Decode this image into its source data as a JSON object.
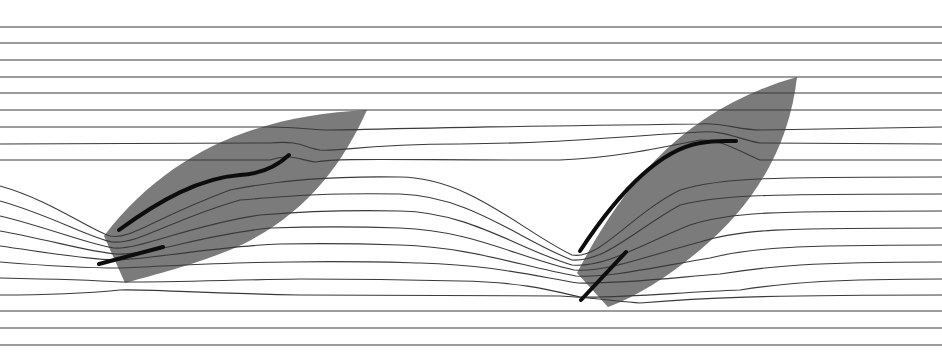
{
  "diagram": {
    "width": 942,
    "height": 357,
    "colors": {
      "background": "#ffffff",
      "hull": "#7b7b7b",
      "streamline": "#3a3a3a",
      "sail": "#0d0d0d"
    },
    "boats": [
      {
        "name": "boat-1",
        "hull": "M104,236 C170,150 260,115 367,110 C340,170 300,220 230,250 C190,266 150,276 125,283 Z",
        "mainsail": "M119,230 C160,200 200,178 240,175 C260,174 275,168 289,155",
        "jib": "M99,264 L163,247"
      },
      {
        "name": "boat-2",
        "hull": "M577,273 C620,190 680,110 797,77 C790,140 760,200 700,250 C670,275 640,295 608,307 Z",
        "mainsail": "M580,251 C620,190 660,150 700,143 C715,140 725,141 736,141",
        "jib": "M581,300 L626,252"
      }
    ],
    "streamlines_top": [
      27,
      43,
      60,
      77,
      93
    ],
    "streamlines_bottom": [
      311,
      328,
      345
    ],
    "streamlines_curved": [
      "M0,110 L942,110",
      "M0,127 L270,127 C300,127 310,130 330,130 C360,130 380,128 700,124 C720,122 740,130 760,130 L942,127",
      "M0,144 L270,143 C300,140 305,148 320,150 C340,152 360,144 460,144 C560,143 600,138 700,132 C725,130 740,140 760,143 L942,144",
      "M0,160 L270,160 C290,153 300,160 315,162 C340,158 380,160 560,160 C610,158 650,150 700,140 C725,140 740,152 760,160 L942,160",
      "M0,186 C50,200 90,230 110,236 C130,240 150,220 230,190 C280,180 330,176 400,177 C470,178 520,230 572,255 C600,260 630,215 680,190 C720,178 760,177 942,177",
      "M0,201 C50,215 90,238 112,242 C140,244 170,220 240,200 C300,195 330,193 400,194 C470,196 520,240 572,260 C605,262 635,230 680,205 C720,195 760,194 942,194",
      "M0,216 C50,228 90,245 114,248 C140,250 190,225 260,215 C320,210 360,210 400,211 C470,212 520,250 572,265 C605,268 640,245 690,225 C730,212 770,211 942,211",
      "M0,231 C50,240 90,252 116,254 C150,256 200,235 270,228 C330,226 370,227 400,228 C470,230 520,258 574,270 C605,273 650,255 700,242 C740,229 780,228 942,228",
      "M0,246 C50,253 90,260 118,260 C160,258 220,246 280,244 C340,243 370,244 400,245 C470,247 520,266 576,276 C610,278 660,266 710,258 C750,248 790,245 942,245",
      "M0,262 C50,266 90,268 120,268 C170,266 230,262 290,262 C350,261 380,262 420,263 C490,265 530,275 578,283 C620,284 670,278 720,274 C770,266 810,262 942,262",
      "M0,278 C50,279 90,280 122,282 C180,282 230,280 300,279 C370,279 420,280 460,281 C520,282 550,290 580,297 C630,298 680,292 740,290 C790,282 840,279 942,279",
      "M0,295 C60,295 100,292 120,290 C140,289 200,293 300,295 C400,296 500,296 560,296 C600,298 620,302 640,303 C700,298 760,295 942,295"
    ]
  }
}
